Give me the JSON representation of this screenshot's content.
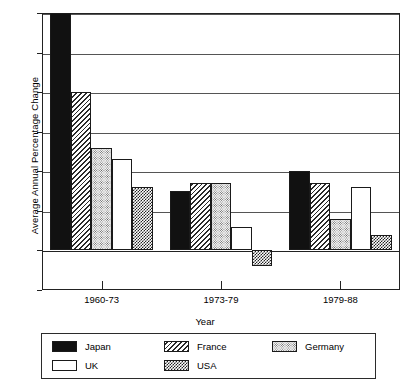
{
  "chart_data": {
    "type": "bar",
    "title": "",
    "xlabel": "Year",
    "ylabel": "Average Annual Percentage Change",
    "categories": [
      "1960-73",
      "1973-79",
      "1979-88"
    ],
    "ylim": [
      -1.0,
      6.0
    ],
    "ytick_labels": [
      "6.0",
      "5.0",
      "4.0",
      "3.0",
      "2.0",
      "1.0",
      "0.0",
      "-1.0"
    ],
    "ytick_values": [
      6.0,
      5.0,
      4.0,
      3.0,
      2.0,
      1.0,
      0.0,
      -1.0
    ],
    "grid": true,
    "legend_position": "bottom",
    "series": [
      {
        "name": "Japan",
        "pattern": "solid-black",
        "values": [
          6.0,
          1.5,
          2.0
        ]
      },
      {
        "name": "France",
        "pattern": "diagonal-hatch",
        "values": [
          4.0,
          1.7,
          1.7
        ]
      },
      {
        "name": "Germany",
        "pattern": "fine-dots",
        "values": [
          2.6,
          1.7,
          0.8
        ]
      },
      {
        "name": "UK",
        "pattern": "white-fill",
        "values": [
          2.3,
          0.6,
          1.6
        ]
      },
      {
        "name": "USA",
        "pattern": "checker",
        "values": [
          1.6,
          -0.4,
          0.4
        ]
      }
    ]
  },
  "legend": {
    "entries": [
      {
        "label": "Japan",
        "swatch": "legend-swatch-japan"
      },
      {
        "label": "France",
        "swatch": "legend-swatch-france"
      },
      {
        "label": "Germany",
        "swatch": "legend-swatch-germany"
      },
      {
        "label": "UK",
        "swatch": "legend-swatch-uk"
      },
      {
        "label": "USA",
        "swatch": "legend-swatch-usa"
      }
    ]
  }
}
